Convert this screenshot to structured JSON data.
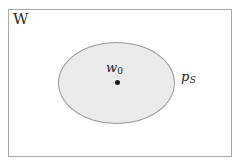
{
  "diagram": {
    "title_label": "W",
    "background_color": "#ffffff",
    "frame": {
      "name": "space-rectangle",
      "border_color": "#a8a8a8",
      "fill_color": "#ffffff"
    },
    "region": {
      "name": "shaded-ellipse",
      "fill_color": "#ebebeb",
      "border_color": "#9a9a9a",
      "label_base": "p",
      "label_subscript": "S"
    },
    "center_point": {
      "name": "center-dot",
      "color": "#1a1a1a",
      "label_base": "w",
      "label_subscript": "0"
    }
  }
}
